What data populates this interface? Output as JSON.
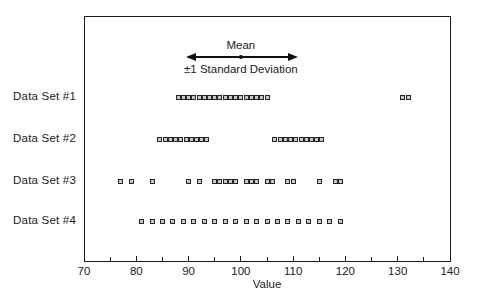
{
  "chart_data": {
    "type": "scatter",
    "title": "",
    "xlabel": "Value",
    "ylabel": "",
    "xlim": [
      70,
      140
    ],
    "x_major_ticks": [
      70,
      80,
      90,
      100,
      110,
      120,
      130,
      140
    ],
    "x_minor_ticks": [
      75,
      85,
      95,
      105,
      115,
      125,
      135
    ],
    "grid": false,
    "marker": "square",
    "legend_position": "none",
    "annotation": {
      "mean_label": "Mean",
      "sd_label": "±1 Standard Deviation",
      "mean": 100,
      "arrow_span": [
        89.5,
        111
      ]
    },
    "series": [
      {
        "name": "Data Set #1",
        "values": [
          88,
          89,
          90,
          91,
          92,
          93,
          94,
          95,
          96,
          97,
          98,
          99,
          100,
          101,
          102,
          103,
          104,
          105,
          131,
          132
        ]
      },
      {
        "name": "Data Set #2",
        "values": [
          84.5,
          85.5,
          86.5,
          87.5,
          88.5,
          89.5,
          90.5,
          91.5,
          92.5,
          93.5,
          106.5,
          107.5,
          108.5,
          109.5,
          110.5,
          111.5,
          112.5,
          113.5,
          114.5,
          115.5
        ]
      },
      {
        "name": "Data Set #3",
        "values": [
          77,
          79,
          83,
          90,
          92,
          95,
          96,
          97,
          98,
          99,
          101,
          102,
          103,
          105,
          106,
          109,
          110,
          115,
          118,
          119
        ]
      },
      {
        "name": "Data Set #4",
        "values": [
          81,
          83,
          85,
          87,
          89,
          91,
          93,
          95,
          97,
          99,
          101,
          103,
          105,
          107,
          109,
          111,
          113,
          115,
          117,
          119
        ]
      }
    ]
  }
}
